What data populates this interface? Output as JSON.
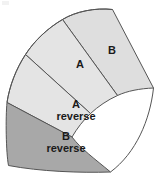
{
  "figure": {
    "name": "annulus-sector-four-bands",
    "background_color": "#ffffff",
    "stroke_color": "#555555",
    "stroke_width": 1,
    "colors": {
      "light_band": "#e4e4e4",
      "mid_band": "#dedede",
      "dark_band": "#a8a8a8",
      "outline": "#555555",
      "text": "#1a1a1a"
    },
    "bands": [
      {
        "id": "b-outer",
        "label": "B",
        "label_lines": [
          "B"
        ],
        "fill": "#dedede",
        "order": 1
      },
      {
        "id": "a-outer",
        "label": "A",
        "label_lines": [
          "A"
        ],
        "fill": "#e4e4e4",
        "order": 2
      },
      {
        "id": "a-reverse",
        "label": "A reverse",
        "label_lines": [
          "A",
          "reverse"
        ],
        "fill": "#e4e4e4",
        "order": 3
      },
      {
        "id": "b-reverse",
        "label": "B reverse",
        "label_lines": [
          "B",
          "reverse"
        ],
        "fill": "#a8a8a8",
        "order": 4
      }
    ]
  }
}
